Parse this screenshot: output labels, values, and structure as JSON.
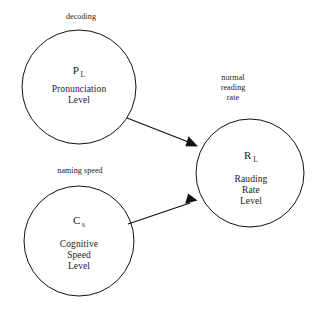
{
  "diagram": {
    "background_color": "#ffffff",
    "stroke_color": "#111111",
    "nodes": [
      {
        "id": "pronunciation-level",
        "symbol_base": "P",
        "symbol_subscript": "L",
        "label_line_1": "Pronunciation",
        "label_line_2": "Level",
        "shape": "circle"
      },
      {
        "id": "cognitive-speed-level",
        "symbol_base": "C",
        "symbol_subscript": "s",
        "label_line_1": "Cognitive",
        "label_line_2": "Speed",
        "label_line_3": "Level",
        "shape": "circle"
      },
      {
        "id": "rauding-rate-level",
        "symbol_base": "R",
        "symbol_subscript": "L",
        "label_line_1": "Rauding",
        "label_line_2": "Rate",
        "label_line_3": "Level",
        "shape": "circle"
      }
    ],
    "edge_labels": {
      "decoding": "decoding",
      "naming_speed": "naming speed",
      "normal_reading_rate_line_1": "normal",
      "normal_reading_rate_line_2": "reading",
      "normal_reading_rate_line_3": "rate"
    },
    "edges": [
      {
        "id": "pl-to-rl",
        "from": "pronunciation-level",
        "to": "rauding-rate-level",
        "arrowhead": "solid-triangle"
      },
      {
        "id": "cs-to-rl",
        "from": "cognitive-speed-level",
        "to": "rauding-rate-level",
        "arrowhead": "solid-triangle"
      }
    ]
  }
}
